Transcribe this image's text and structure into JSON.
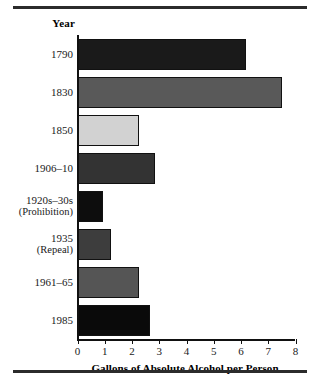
{
  "chart_data": {
    "type": "bar",
    "orientation": "horizontal",
    "title": "",
    "categories": [
      "1790",
      "1830",
      "1850",
      "1906–10",
      "1920s–30s (Prohibition)",
      "1935 (Repeal)",
      "1961–65",
      "1985"
    ],
    "values": [
      6.1,
      7.4,
      2.2,
      2.8,
      0.9,
      1.2,
      2.2,
      2.6
    ],
    "xlabel": "Gallons of Absolute Alcohol per Person",
    "ylabel": "Year",
    "xlim": [
      0,
      8
    ],
    "xticks": [
      0,
      1,
      2,
      3,
      4,
      5,
      6,
      7,
      8
    ],
    "xticklabels": [
      "0",
      "1",
      "2",
      "3",
      "4",
      "5",
      "6",
      "7",
      "8"
    ],
    "grid": false,
    "legend": null,
    "bar_colors": [
      "#1a1a1a",
      "#595959",
      "#d2d2d2",
      "#333333",
      "#0d0d0d",
      "#3d3d3d",
      "#555555",
      "#0a0a0a"
    ]
  },
  "axis": {
    "year_header": "Year",
    "x_title": "Gallons of Absolute Alcohol per Person",
    "tick_labels": [
      "0",
      "1",
      "2",
      "3",
      "4",
      "5",
      "6",
      "7",
      "8"
    ]
  },
  "rows": [
    {
      "label_line1": "1790",
      "label_line2": "",
      "value": 6.1,
      "color": "#1a1a1a"
    },
    {
      "label_line1": "1830",
      "label_line2": "",
      "value": 7.4,
      "color": "#595959"
    },
    {
      "label_line1": "1850",
      "label_line2": "",
      "value": 2.2,
      "color": "#d2d2d2"
    },
    {
      "label_line1": "1906–10",
      "label_line2": "",
      "value": 2.8,
      "color": "#333333"
    },
    {
      "label_line1": "1920s–30s",
      "label_line2": "(Prohibition)",
      "value": 0.9,
      "color": "#0d0d0d"
    },
    {
      "label_line1": "1935",
      "label_line2": "(Repeal)",
      "value": 1.2,
      "color": "#3d3d3d"
    },
    {
      "label_line1": "1961–65",
      "label_line2": "",
      "value": 2.2,
      "color": "#555555"
    },
    {
      "label_line1": "1985",
      "label_line2": "",
      "value": 2.6,
      "color": "#0a0a0a"
    }
  ],
  "colors": {
    "rule": "#2b2b2b",
    "axis": "#111111",
    "text": "#1a1a1a"
  }
}
